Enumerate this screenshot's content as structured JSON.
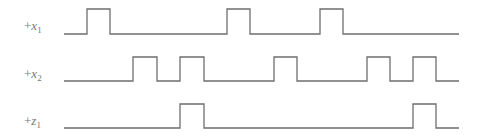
{
  "diagram": {
    "type": "timing-diagram",
    "line_color": "#6e6e6e",
    "label_color": "#777777",
    "x_start": 64,
    "x_end": 459,
    "signals": [
      {
        "name": "x1",
        "label_prefix": "+",
        "label_var": "x",
        "label_sub": "1",
        "label_x": 24,
        "label_y": 19,
        "y_high": 9,
        "y_low": 34,
        "pulses": [
          [
            87,
            110
          ],
          [
            227,
            250
          ],
          [
            320,
            343
          ]
        ]
      },
      {
        "name": "x2",
        "label_prefix": "+",
        "label_var": "x",
        "label_sub": "2",
        "label_x": 24,
        "label_y": 67,
        "y_high": 57,
        "y_low": 81,
        "pulses": [
          [
            133,
            157
          ],
          [
            180,
            204
          ],
          [
            274,
            297
          ],
          [
            367,
            390
          ],
          [
            413,
            436
          ]
        ]
      },
      {
        "name": "z1",
        "label_prefix": "+",
        "label_var": "z",
        "label_sub": "1",
        "label_x": 24,
        "label_y": 114,
        "y_high": 104,
        "y_low": 128,
        "pulses": [
          [
            180,
            204
          ],
          [
            413,
            436
          ]
        ]
      }
    ]
  }
}
